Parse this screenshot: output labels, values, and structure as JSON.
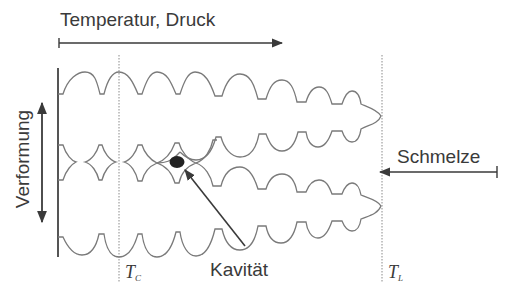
{
  "diagram": {
    "type": "schematic",
    "labels": {
      "top_arrow": "Temperatur, Druck",
      "vertical_arrow": "Verformung",
      "melt_arrow": "Schmelze",
      "cavity": "Kavität",
      "tc_main": "T",
      "tc_sub": "C",
      "tl_main": "T",
      "tl_sub": "L"
    },
    "colors": {
      "line": "#7a7a7a",
      "arrow": "#3a3a3a",
      "cavity_fill": "#222222",
      "text": "#3a3a3a"
    },
    "elements": [
      {
        "kind": "arrow",
        "label": "Temperatur, Druck",
        "direction": "right"
      },
      {
        "kind": "double-arrow",
        "label": "Verformung",
        "direction": "vertical"
      },
      {
        "kind": "arrow",
        "label": "Schmelze",
        "direction": "left"
      },
      {
        "kind": "dotted-line",
        "label": "T_C"
      },
      {
        "kind": "dotted-line",
        "label": "T_L"
      },
      {
        "kind": "cavity-dot",
        "label": "Kavität"
      }
    ]
  }
}
